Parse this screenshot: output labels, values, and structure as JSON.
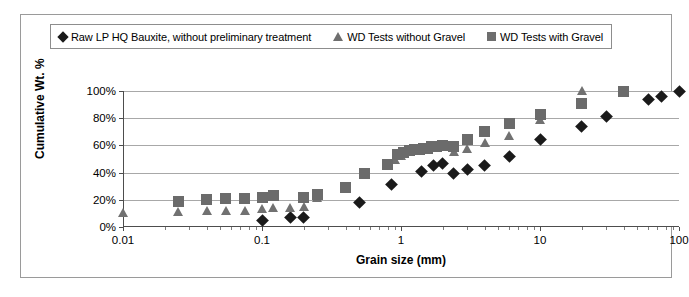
{
  "chart_data": {
    "type": "scatter",
    "title": "",
    "xlabel": "Grain size (mm)",
    "ylabel": "Cumulative Wt. %",
    "xscale": "log",
    "xlim": [
      0.01,
      100
    ],
    "ylim": [
      0,
      100
    ],
    "xticks": [
      "0.01",
      "0.1",
      "1",
      "10",
      "100"
    ],
    "yticks": [
      "0%",
      "20%",
      "40%",
      "60%",
      "80%",
      "100%"
    ],
    "grid": "horizontal",
    "legend_position": "top",
    "series": [
      {
        "name": "Raw LP HQ Bauxite, without preliminary treatment",
        "marker": "diamond",
        "color": "#1a1a1a",
        "points": [
          [
            0.1,
            5
          ],
          [
            0.16,
            7
          ],
          [
            0.2,
            7
          ],
          [
            0.5,
            18
          ],
          [
            0.85,
            31
          ],
          [
            1.4,
            41
          ],
          [
            1.7,
            45
          ],
          [
            2.0,
            47
          ],
          [
            2.4,
            39
          ],
          [
            3.0,
            42
          ],
          [
            4.0,
            45
          ],
          [
            6.0,
            52
          ],
          [
            10.0,
            64
          ],
          [
            20.0,
            74
          ],
          [
            30.0,
            81
          ],
          [
            60.0,
            94
          ],
          [
            75.0,
            96
          ],
          [
            100.0,
            100
          ]
        ]
      },
      {
        "name": "WD Tests without Gravel",
        "marker": "triangle",
        "color": "#717171",
        "points": [
          [
            0.01,
            10
          ],
          [
            0.025,
            11
          ],
          [
            0.04,
            12
          ],
          [
            0.055,
            12
          ],
          [
            0.075,
            12
          ],
          [
            0.1,
            13
          ],
          [
            0.12,
            14
          ],
          [
            0.16,
            14
          ],
          [
            0.2,
            15
          ],
          [
            0.25,
            21
          ],
          [
            0.9,
            49
          ],
          [
            1.0,
            52
          ],
          [
            2.4,
            55
          ],
          [
            3.0,
            57
          ],
          [
            4.0,
            62
          ],
          [
            6.0,
            67
          ],
          [
            10.0,
            79
          ],
          [
            20.0,
            100
          ]
        ]
      },
      {
        "name": "WD Tests with Gravel",
        "marker": "square",
        "color": "#6b6b6b",
        "points": [
          [
            0.025,
            19
          ],
          [
            0.04,
            20
          ],
          [
            0.055,
            21
          ],
          [
            0.075,
            21
          ],
          [
            0.1,
            22
          ],
          [
            0.12,
            23
          ],
          [
            0.2,
            22
          ],
          [
            0.25,
            24
          ],
          [
            0.4,
            29
          ],
          [
            0.55,
            39
          ],
          [
            0.8,
            46
          ],
          [
            0.95,
            53
          ],
          [
            1.05,
            55
          ],
          [
            1.15,
            56
          ],
          [
            1.25,
            57
          ],
          [
            1.35,
            57
          ],
          [
            1.45,
            58
          ],
          [
            1.55,
            58
          ],
          [
            1.65,
            59
          ],
          [
            1.8,
            59
          ],
          [
            2.0,
            60
          ],
          [
            2.4,
            59
          ],
          [
            3.0,
            64
          ],
          [
            4.0,
            70
          ],
          [
            6.0,
            76
          ],
          [
            10.0,
            83
          ],
          [
            20.0,
            91
          ],
          [
            40.0,
            100
          ]
        ]
      }
    ]
  },
  "legend": {
    "items": [
      {
        "label": "Raw LP HQ Bauxite, without preliminary treatment",
        "marker": "diamond"
      },
      {
        "label": "WD Tests without Gravel",
        "marker": "triangle"
      },
      {
        "label": "WD Tests with Gravel",
        "marker": "square"
      }
    ]
  }
}
